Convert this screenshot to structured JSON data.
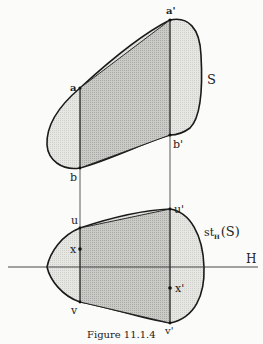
{
  "figure": {
    "caption": "Figure 11.1.4",
    "upper_shape_label": "S",
    "lower_shape_label_main": "st",
    "lower_shape_label_sub": "H",
    "lower_shape_label_arg": "(S)",
    "hyperplane_label": "H",
    "points": {
      "a": "a",
      "a_prime": "a'",
      "b": "b",
      "b_prime": "b'",
      "u": "u",
      "u_prime": "u'",
      "x": "x",
      "x_prime": "x'",
      "v": "v",
      "v_prime": "v'"
    }
  },
  "colors": {
    "outline": "#1a1a1a",
    "light_fill": "#e4e4e0",
    "dark_fill": "#c4c4c0",
    "background": "#fbfbf9"
  }
}
